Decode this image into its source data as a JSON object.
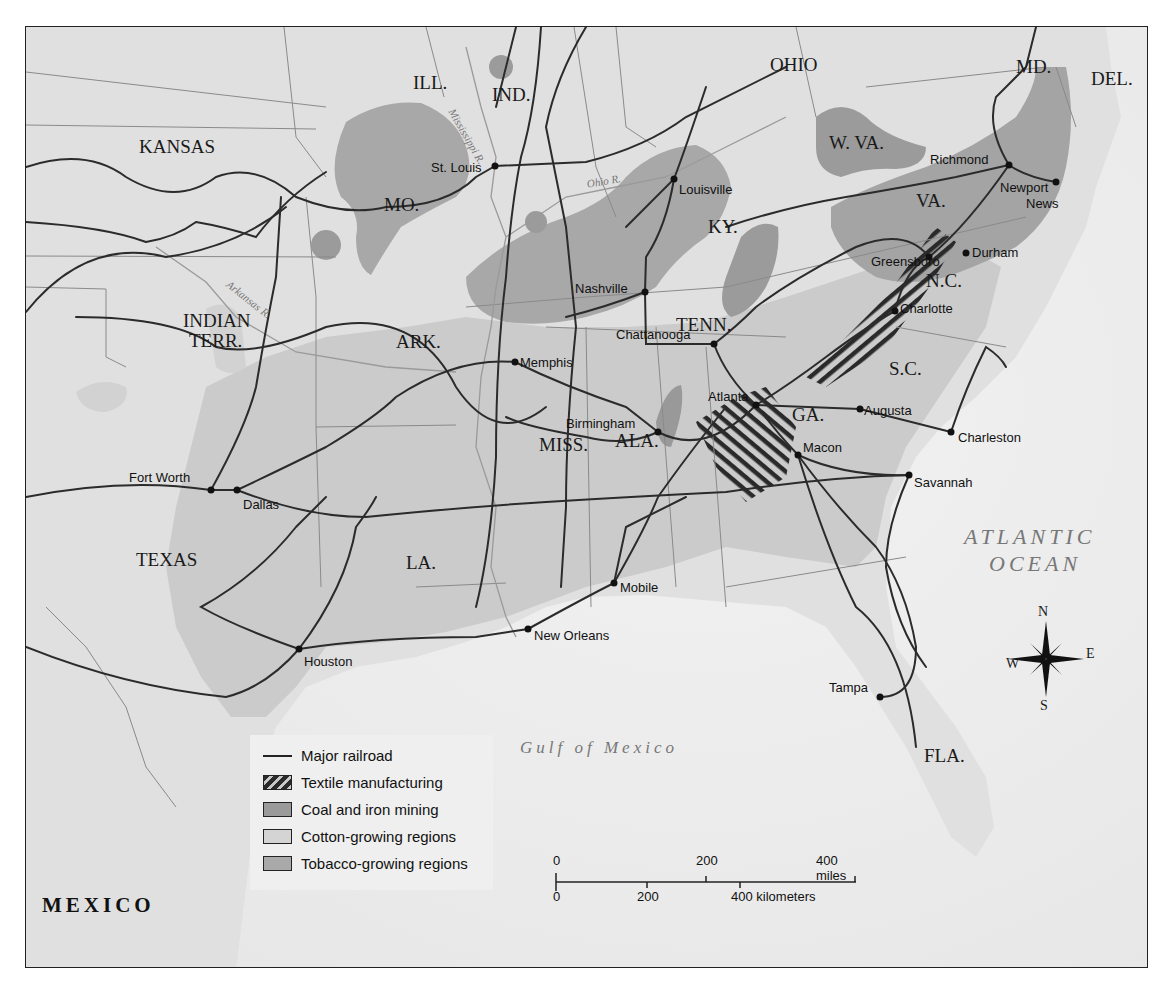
{
  "map": {
    "title": "",
    "states": [
      {
        "name": "ILL.",
        "x": 387,
        "y": 46
      },
      {
        "name": "IND.",
        "x": 466,
        "y": 58
      },
      {
        "name": "OHIO",
        "x": 744,
        "y": 28
      },
      {
        "name": "MD.",
        "x": 990,
        "y": 30
      },
      {
        "name": "DEL.",
        "x": 1065,
        "y": 42
      },
      {
        "name": "KANSAS",
        "x": 113,
        "y": 110
      },
      {
        "name": "W. VA.",
        "x": 803,
        "y": 106
      },
      {
        "name": "MO.",
        "x": 358,
        "y": 168
      },
      {
        "name": "KY.",
        "x": 682,
        "y": 190
      },
      {
        "name": "VA.",
        "x": 890,
        "y": 164
      },
      {
        "name": "N.C.",
        "x": 900,
        "y": 244
      },
      {
        "name": "INDIAN",
        "x": 157,
        "y": 284
      },
      {
        "name": "TERR.",
        "x": 163,
        "y": 304
      },
      {
        "name": "TENN.",
        "x": 650,
        "y": 288
      },
      {
        "name": "ARK.",
        "x": 370,
        "y": 305
      },
      {
        "name": "S.C.",
        "x": 863,
        "y": 332
      },
      {
        "name": "GA.",
        "x": 766,
        "y": 378
      },
      {
        "name": "MISS.",
        "x": 513,
        "y": 408
      },
      {
        "name": "ALA.",
        "x": 589,
        "y": 404
      },
      {
        "name": "LA.",
        "x": 380,
        "y": 526
      },
      {
        "name": "TEXAS",
        "x": 110,
        "y": 523
      },
      {
        "name": "FLA.",
        "x": 898,
        "y": 719
      }
    ],
    "cities": [
      {
        "name": "St. Louis",
        "dot_x": 469,
        "dot_y": 139,
        "label_x": 405,
        "label_y": 134
      },
      {
        "name": "Louisville",
        "dot_x": 648,
        "dot_y": 152,
        "label_x": 653,
        "label_y": 156
      },
      {
        "name": "Richmond",
        "dot_x": 983,
        "dot_y": 138,
        "label_x": 904,
        "label_y": 126
      },
      {
        "name": "Newport",
        "dot_x": 1030,
        "dot_y": 155,
        "label_x": 974,
        "label_y": 154
      },
      {
        "name": "News",
        "dot_x": null,
        "dot_y": null,
        "label_x": 1000,
        "label_y": 170
      },
      {
        "name": "Durham",
        "dot_x": 940,
        "dot_y": 226,
        "label_x": 946,
        "label_y": 219
      },
      {
        "name": "Greensboro",
        "dot_x": 903,
        "dot_y": 230,
        "label_x": 845,
        "label_y": 228
      },
      {
        "name": "Charlotte",
        "dot_x": 869,
        "dot_y": 284,
        "label_x": 874,
        "label_y": 275
      },
      {
        "name": "Nashville",
        "dot_x": 619,
        "dot_y": 265,
        "label_x": 549,
        "label_y": 255
      },
      {
        "name": "Chattanooga",
        "dot_x": 688,
        "dot_y": 317,
        "label_x": 590,
        "label_y": 301
      },
      {
        "name": "Memphis",
        "dot_x": 489,
        "dot_y": 335,
        "label_x": 494,
        "label_y": 329
      },
      {
        "name": "Atlanta",
        "dot_x": 730,
        "dot_y": 378,
        "label_x": 682,
        "label_y": 363
      },
      {
        "name": "Augusta",
        "dot_x": 834,
        "dot_y": 382,
        "label_x": 838,
        "label_y": 377
      },
      {
        "name": "Birmingham",
        "dot_x": 632,
        "dot_y": 405,
        "label_x": 540,
        "label_y": 390
      },
      {
        "name": "Charleston",
        "dot_x": 925,
        "dot_y": 405,
        "label_x": 932,
        "label_y": 404
      },
      {
        "name": "Macon",
        "dot_x": 772,
        "dot_y": 428,
        "label_x": 777,
        "label_y": 414
      },
      {
        "name": "Fort Worth",
        "dot_x": 185,
        "dot_y": 463,
        "label_x": 103,
        "label_y": 444
      },
      {
        "name": "Dallas",
        "dot_x": 211,
        "dot_y": 463,
        "label_x": 217,
        "label_y": 471
      },
      {
        "name": "Savannah",
        "dot_x": 883,
        "dot_y": 448,
        "label_x": 888,
        "label_y": 449
      },
      {
        "name": "Mobile",
        "dot_x": 588,
        "dot_y": 556,
        "label_x": 594,
        "label_y": 554
      },
      {
        "name": "New Orleans",
        "dot_x": 502,
        "dot_y": 602,
        "label_x": 508,
        "label_y": 602
      },
      {
        "name": "Houston",
        "dot_x": 273,
        "dot_y": 622,
        "label_x": 278,
        "label_y": 628
      },
      {
        "name": "Tampa",
        "dot_x": 854,
        "dot_y": 670,
        "label_x": 803,
        "label_y": 654
      }
    ],
    "rivers": [
      {
        "name": "Mississippi R.",
        "x": 430,
        "y": 80,
        "rotate": 60
      },
      {
        "name": "Ohio R.",
        "x": 560,
        "y": 152,
        "rotate": -10
      },
      {
        "name": "Arkansas R.",
        "x": 205,
        "y": 252,
        "rotate": 38
      }
    ],
    "water_bodies": [
      {
        "name": "ATLANTIC",
        "x": 938,
        "y": 499,
        "size": 22
      },
      {
        "name": "OCEAN",
        "x": 963,
        "y": 526,
        "size": 22
      },
      {
        "name": "Gulf of Mexico",
        "x": 494,
        "y": 712,
        "size": 17
      }
    ],
    "countries": [
      {
        "name": "MEXICO",
        "x": 16,
        "y": 868
      }
    ],
    "compass": {
      "n": "N",
      "s": "S",
      "e": "E",
      "w": "W",
      "cx": 1020,
      "cy": 632
    }
  },
  "legend": {
    "items": [
      {
        "type": "line",
        "label": "Major railroad"
      },
      {
        "type": "textile",
        "label": "Textile manufacturing"
      },
      {
        "type": "coal",
        "label": "Coal and iron mining"
      },
      {
        "type": "cotton",
        "label": "Cotton-growing regions"
      },
      {
        "type": "tobacco",
        "label": "Tobacco-growing regions"
      }
    ]
  },
  "scale": {
    "miles": {
      "ticks": [
        "0",
        "200",
        "400 miles"
      ]
    },
    "kilometers": {
      "ticks": [
        "0",
        "200",
        "400 kilometers"
      ]
    }
  },
  "colors": {
    "land": "#e2e2e2",
    "water": "#ededed",
    "cotton": "#cdcdcd",
    "tobacco": "#a6a6a6",
    "coal": "#969696",
    "railroad": "#2b2b2b",
    "border": "#8a8a8a"
  }
}
